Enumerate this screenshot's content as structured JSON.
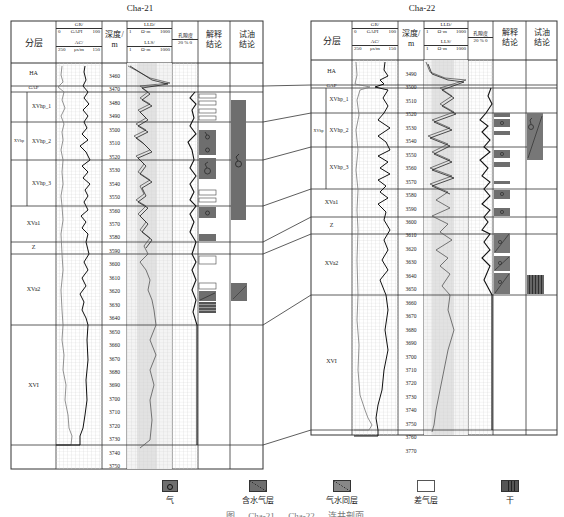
{
  "wells": [
    {
      "name": "Cha-21",
      "header": {
        "layer": "分层",
        "gr_label": "GR/",
        "gr_unit": "GAPI",
        "gr_min": "0",
        "gr_max": "100",
        "ac_label": "AC/",
        "ac_unit": "μs/m",
        "ac_min": "250",
        "ac_max": "150",
        "depth_label": "深度/",
        "depth_unit": "m",
        "lld_label": "LLD/",
        "lld_unit": "Ω·m",
        "lld_min": "1",
        "lld_max": "1000",
        "lls_label": "LLS/",
        "lls_unit": "Ω·m",
        "lls_min": "1",
        "lls_max": "1000",
        "porosity_label": "孔隙度",
        "porosity_scale": "20  %  0",
        "interp_label": "解释结论",
        "test_label": "试油结论"
      },
      "depths": [
        "3460",
        "3470",
        "3480",
        "3490",
        "3500",
        "3510",
        "3520",
        "3530",
        "3540",
        "3550",
        "3560",
        "3570",
        "3580",
        "3590",
        "3600",
        "3610",
        "3620",
        "3630",
        "3640",
        "3650",
        "3660",
        "3670",
        "3680",
        "3690",
        "3700",
        "3710",
        "3720",
        "3730",
        "3740",
        "3750"
      ],
      "layers": [
        "HA",
        "GAP",
        "XVhp_1",
        "XVhp_2",
        "XVhp_3",
        "XVa1",
        "Z",
        "XVa2",
        "XVI"
      ],
      "group": "XVhp"
    },
    {
      "name": "Cha-22",
      "header": {
        "layer": "分层",
        "gr_label": "GR/",
        "gr_unit": "GAPI",
        "gr_min": "0",
        "gr_max": "100",
        "ac_label": "AC/",
        "ac_unit": "μs/m",
        "ac_min": "250",
        "ac_max": "150",
        "depth_label": "深度/",
        "depth_unit": "m",
        "lld_label": "LLD/",
        "lld_unit": "Ω·m",
        "lld_min": "1",
        "lld_max": "1000",
        "lls_label": "LLS/",
        "lls_unit": "Ω·m",
        "lls_min": "1",
        "lls_max": "1000",
        "porosity_label": "孔隙度",
        "porosity_scale": "20  %  0",
        "interp_label": "解释结论",
        "test_label": "试油结论"
      },
      "depths": [
        "3490",
        "3500",
        "3510",
        "3520",
        "3530",
        "3540",
        "3550",
        "3560",
        "3570",
        "3580",
        "3590",
        "3600",
        "3610",
        "3620",
        "3630",
        "3640",
        "3650",
        "3660",
        "3670",
        "3680",
        "3690",
        "3700",
        "3710",
        "3720",
        "3730",
        "3740",
        "3750",
        "3760",
        "3770"
      ],
      "layers": [
        "HA",
        "GAP",
        "XVhp_1",
        "XVhp_2",
        "XVhp_3",
        "XVa1",
        "Z",
        "XVa2",
        "XVI"
      ],
      "group": "XVhp"
    }
  ],
  "legend": [
    {
      "key": "gas",
      "label": "气",
      "color": "#777777"
    },
    {
      "key": "water-bearing-gas",
      "label": "含水气层",
      "color": "#777777"
    },
    {
      "key": "gas-water",
      "label": "气水同层",
      "color": "#888888"
    },
    {
      "key": "poor-gas",
      "label": "差气层",
      "color": "#ffffff"
    },
    {
      "key": "dry",
      "label": "干",
      "color": "#555555"
    }
  ],
  "caption": "图 … Cha-21 … Cha-22 … 连井剖面",
  "colors": {
    "line": "#333333",
    "fill_dark": "#6e6e6e",
    "grid": "#cfcfcf",
    "shade": "#e6e6e6"
  }
}
